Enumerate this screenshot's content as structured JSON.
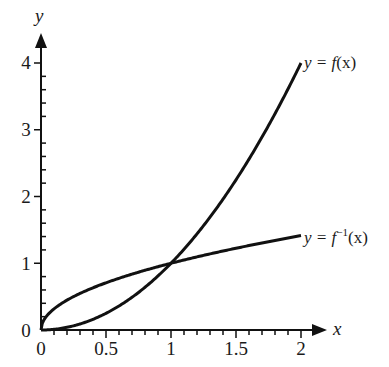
{
  "chart_data": {
    "type": "line",
    "title": "",
    "xlabel": "x",
    "ylabel": "y",
    "xlim": [
      0,
      2
    ],
    "ylim": [
      0,
      4
    ],
    "grid": false,
    "legend": "inline labels at curve ends",
    "x_ticks": [
      "0",
      "0.5",
      "1",
      "1.5",
      "2"
    ],
    "y_ticks": [
      "0",
      "1",
      "2",
      "3",
      "4"
    ],
    "series": [
      {
        "name": "y = f(x)",
        "function": "x^2",
        "x": [
          0,
          0.25,
          0.5,
          0.75,
          1,
          1.25,
          1.5,
          1.75,
          2
        ],
        "values": [
          0,
          0.0625,
          0.25,
          0.5625,
          1,
          1.5625,
          2.25,
          3.0625,
          4
        ]
      },
      {
        "name": "y = f^-1(x)",
        "function": "sqrt(x)",
        "x": [
          0,
          0.25,
          0.5,
          0.75,
          1,
          1.25,
          1.5,
          1.75,
          2
        ],
        "values": [
          0,
          0.5,
          0.707,
          0.866,
          1,
          1.118,
          1.225,
          1.323,
          1.414
        ]
      }
    ],
    "annotations": [
      "Curves intersect at (1, 1)"
    ]
  },
  "labels": {
    "x_axis": "x",
    "y_axis": "y",
    "f_label_prefix": "y = ",
    "f_label_func": "f",
    "f_label_arg": "(x)",
    "finv_label_prefix": "y = ",
    "finv_label_func": "f",
    "finv_label_sup": "−1",
    "finv_label_arg": "(x)",
    "x_tick_0": "0",
    "x_tick_05": "0.5",
    "x_tick_1": "1",
    "x_tick_15": "1.5",
    "x_tick_2": "2",
    "y_tick_0": "0",
    "y_tick_1": "1",
    "y_tick_2": "2",
    "y_tick_3": "3",
    "y_tick_4": "4"
  }
}
